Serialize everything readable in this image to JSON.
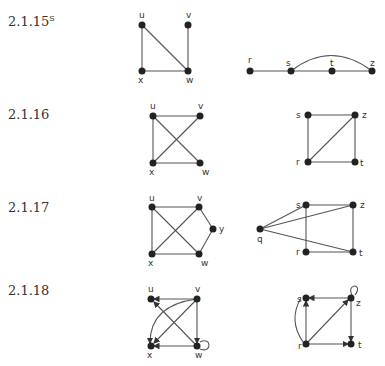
{
  "problems": [
    {
      "id": "2.1.15",
      "suffix": "S",
      "left": {
        "vertices": [
          "u",
          "v",
          "x",
          "w"
        ],
        "edges": [
          [
            "u",
            "x"
          ],
          [
            "u",
            "w"
          ],
          [
            "v",
            "w"
          ],
          [
            "x",
            "w"
          ]
        ]
      },
      "right": {
        "vertices": [
          "r",
          "s",
          "t",
          "z"
        ],
        "edges": [
          [
            "r",
            "s"
          ],
          [
            "s",
            "t"
          ],
          [
            "t",
            "z"
          ],
          [
            "s",
            "z"
          ]
        ]
      }
    },
    {
      "id": "2.1.16",
      "suffix": "",
      "left": {
        "vertices": [
          "u",
          "v",
          "x",
          "w"
        ],
        "edges": [
          [
            "u",
            "v"
          ],
          [
            "u",
            "x"
          ],
          [
            "u",
            "w"
          ],
          [
            "v",
            "x"
          ],
          [
            "x",
            "w"
          ]
        ]
      },
      "right": {
        "vertices": [
          "s",
          "z",
          "r",
          "t"
        ],
        "edges": [
          [
            "s",
            "z"
          ],
          [
            "s",
            "r"
          ],
          [
            "r",
            "z"
          ],
          [
            "z",
            "t"
          ],
          [
            "r",
            "t"
          ]
        ]
      }
    },
    {
      "id": "2.1.17",
      "suffix": "",
      "left": {
        "vertices": [
          "u",
          "v",
          "y",
          "x",
          "w"
        ],
        "edges": [
          [
            "u",
            "v"
          ],
          [
            "u",
            "x"
          ],
          [
            "u",
            "w"
          ],
          [
            "v",
            "x"
          ],
          [
            "v",
            "y"
          ],
          [
            "y",
            "w"
          ],
          [
            "x",
            "w"
          ]
        ]
      },
      "right": {
        "vertices": [
          "s",
          "z",
          "q",
          "r",
          "t"
        ],
        "edges": [
          [
            "s",
            "z"
          ],
          [
            "s",
            "r"
          ],
          [
            "z",
            "t"
          ],
          [
            "r",
            "t"
          ],
          [
            "q",
            "s"
          ],
          [
            "q",
            "z"
          ],
          [
            "q",
            "t"
          ]
        ]
      }
    },
    {
      "id": "2.1.18",
      "suffix": "",
      "left": {
        "vertices": [
          "u",
          "v",
          "x",
          "w"
        ],
        "directed": true
      },
      "right": {
        "vertices": [
          "s",
          "z",
          "r",
          "t"
        ],
        "directed": true
      }
    }
  ]
}
